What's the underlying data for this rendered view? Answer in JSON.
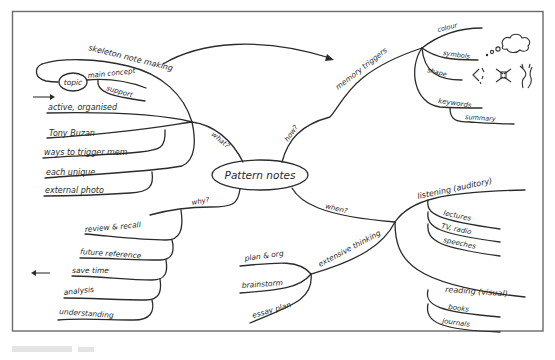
{
  "diagram": {
    "type": "mind-map",
    "style": "hand-drawn pattern notes",
    "center": {
      "label": "Pattern notes"
    },
    "branches": [
      {
        "id": "what",
        "label": "what?",
        "children": [
          {
            "label": "skeleton note making",
            "children": [
              {
                "label": "topic"
              },
              {
                "label": "main concept"
              },
              {
                "label": "support"
              }
            ]
          },
          {
            "label": "active, organised"
          },
          {
            "label": "Tony Buzan"
          },
          {
            "label": "ways to trigger mem"
          },
          {
            "label": "each unique"
          },
          {
            "label": "external photo"
          }
        ]
      },
      {
        "id": "how",
        "label": "how?",
        "children": [
          {
            "label": "memory triggers",
            "children": [
              {
                "label": "colour"
              },
              {
                "label": "symbols"
              },
              {
                "label": "shape"
              },
              {
                "label": "keywords",
                "children": [
                  {
                    "label": "summary"
                  }
                ]
              }
            ]
          }
        ]
      },
      {
        "id": "why",
        "label": "why?",
        "children": [
          {
            "label": "review & recall"
          },
          {
            "label": "future reference"
          },
          {
            "label": "save time"
          },
          {
            "label": "analysis"
          },
          {
            "label": "understanding"
          }
        ]
      },
      {
        "id": "when",
        "label": "when?",
        "children": [
          {
            "label": "listening (auditory)",
            "children": [
              {
                "label": "lectures"
              },
              {
                "label": "TV, radio"
              },
              {
                "label": "speeches"
              }
            ]
          },
          {
            "label": "extensive thinking",
            "children": [
              {
                "label": "plan & org"
              },
              {
                "label": "brainstorm"
              },
              {
                "label": "essay plan"
              }
            ]
          },
          {
            "label": "reading (visual)",
            "children": [
              {
                "label": "books"
              },
              {
                "label": "journals"
              }
            ]
          }
        ]
      }
    ],
    "decorations": [
      {
        "name": "thought-cloud",
        "meaning": "symbols"
      },
      {
        "name": "shape-doodles",
        "meaning": "shape"
      },
      {
        "name": "arrow-right",
        "position": "left, pointing to active, organised"
      },
      {
        "name": "arrow-left",
        "position": "left, near save time"
      },
      {
        "name": "arrow-curved",
        "from": "skeleton note making",
        "to": "memory triggers"
      }
    ],
    "colors": {
      "ink": "#2b2b2b",
      "frame": "#6a6a6a",
      "paper": "#ffffff"
    }
  }
}
